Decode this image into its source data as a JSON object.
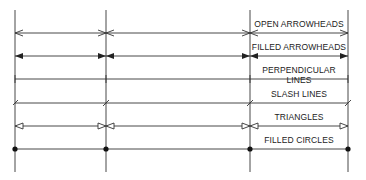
{
  "diagram": {
    "extension_lines_x": [
      15,
      106,
      250,
      348
    ],
    "rows": [
      {
        "label": "OPEN ARROWHEADS",
        "style": "open-arrow",
        "y": 33
      },
      {
        "label": "FILLED ARROWHEADS",
        "style": "filled-arrow",
        "y": 56
      },
      {
        "label": "PERPENDICULAR LINES",
        "style": "perpendicular",
        "y": 79
      },
      {
        "label": "SLASH LINES",
        "style": "slash",
        "y": 103
      },
      {
        "label": "TRIANGLES",
        "style": "triangle",
        "y": 126
      },
      {
        "label": "FILLED CIRCLES",
        "style": "filled-circle",
        "y": 149
      }
    ],
    "line_color": "#333333"
  }
}
